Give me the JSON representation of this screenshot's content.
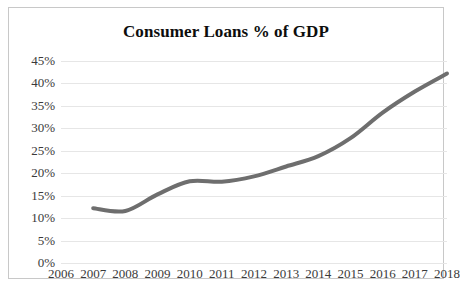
{
  "chart_data": {
    "type": "line",
    "title": "Consumer Loans % of GDP",
    "xlabel": "",
    "ylabel": "",
    "ylim": [
      0,
      45
    ],
    "ytick_labels": [
      "45%",
      "40%",
      "35%",
      "30%",
      "25%",
      "20%",
      "15%",
      "10%",
      "5%",
      "0%"
    ],
    "ytick_values": [
      45,
      40,
      35,
      30,
      25,
      20,
      15,
      10,
      5,
      0
    ],
    "categories": [
      "2006",
      "2007",
      "2008",
      "2009",
      "2010",
      "2011",
      "2012",
      "2013",
      "2014",
      "2015",
      "2016",
      "2017",
      "2018"
    ],
    "x": [
      2006,
      2007,
      2008,
      2009,
      2010,
      2011,
      2012,
      2013,
      2014,
      2015,
      2016,
      2017,
      2018
    ],
    "values": [
      null,
      12.2,
      11.6,
      15.3,
      18.2,
      18.1,
      19.3,
      21.5,
      23.8,
      27.8,
      33.5,
      38.2,
      42.2
    ],
    "series": [
      {
        "name": "Consumer Loans % of GDP",
        "values": [
          null,
          12.2,
          11.6,
          15.3,
          18.2,
          18.1,
          19.3,
          21.5,
          23.8,
          27.8,
          33.5,
          38.2,
          42.2
        ],
        "color": "#6e6e6e",
        "line_width": 4
      }
    ],
    "grid": true,
    "grid_color": "#e6e6e6",
    "legend": false,
    "legend_position": "none",
    "border_color": "#c8c8c8",
    "background": "#ffffff",
    "tick_color": "#3a3a3a"
  }
}
